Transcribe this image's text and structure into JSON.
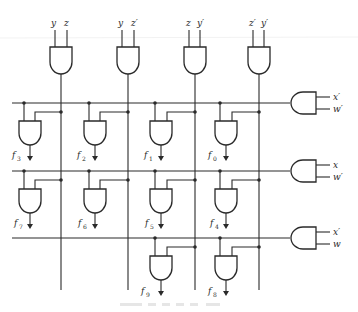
{
  "diagram": {
    "type": "decoder-logic-circuit",
    "top_gates": [
      {
        "id": "g-yz",
        "inputs": [
          "y",
          "z"
        ]
      },
      {
        "id": "g-yz'",
        "inputs": [
          "y",
          "z′"
        ]
      },
      {
        "id": "g-zy'",
        "inputs": [
          "z",
          "y′"
        ]
      },
      {
        "id": "g-z'y'",
        "inputs": [
          "z′",
          "y′"
        ]
      }
    ],
    "row_gates": [
      {
        "id": "r1",
        "inputs": [
          "x′",
          "w′"
        ]
      },
      {
        "id": "r2",
        "inputs": [
          "x",
          "w′"
        ]
      },
      {
        "id": "r3",
        "inputs": [
          "x′",
          "w"
        ]
      }
    ],
    "outputs": {
      "row1": [
        "f3",
        "f2",
        "f1",
        "f0"
      ],
      "row2": [
        "f7",
        "f6",
        "f5",
        "f4"
      ],
      "row3": [
        "f9",
        "f8"
      ]
    },
    "output_labels": {
      "f0": {
        "base": "f",
        "sub": "0"
      },
      "f1": {
        "base": "f",
        "sub": "1"
      },
      "f2": {
        "base": "f",
        "sub": "2"
      },
      "f3": {
        "base": "f",
        "sub": "3"
      },
      "f4": {
        "base": "f",
        "sub": "4"
      },
      "f5": {
        "base": "f",
        "sub": "5"
      },
      "f6": {
        "base": "f",
        "sub": "6"
      },
      "f7": {
        "base": "f",
        "sub": "7"
      },
      "f8": {
        "base": "f",
        "sub": "8"
      },
      "f9": {
        "base": "f",
        "sub": "9"
      }
    },
    "caption": ""
  }
}
